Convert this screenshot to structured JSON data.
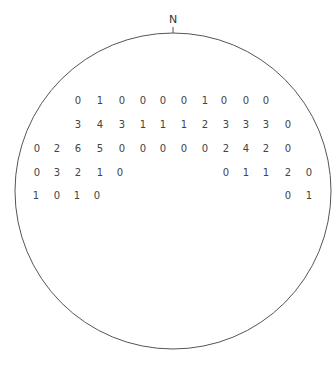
{
  "diagram": {
    "type": "stereonet-count-grid",
    "north_label": "N",
    "circle": {
      "cx": 173,
      "cy": 191,
      "r": 158,
      "stroke": "#555555"
    },
    "rows": [
      {
        "y": 100,
        "cells": [
          {
            "x": 78,
            "v": "0"
          },
          {
            "x": 100,
            "v": "1"
          },
          {
            "x": 122,
            "v": "0"
          },
          {
            "x": 143,
            "v": "0"
          },
          {
            "x": 163,
            "v": "0"
          },
          {
            "x": 184,
            "v": "0"
          },
          {
            "x": 205,
            "v": "1"
          },
          {
            "x": 224,
            "v": "0"
          },
          {
            "x": 246,
            "v": "0"
          },
          {
            "x": 266,
            "v": "0"
          }
        ]
      },
      {
        "y": 124,
        "cells": [
          {
            "x": 78,
            "v": "3"
          },
          {
            "x": 100,
            "v": "4"
          },
          {
            "x": 122,
            "v": "3"
          },
          {
            "x": 143,
            "v": "1"
          },
          {
            "x": 163,
            "v": "1"
          },
          {
            "x": 184,
            "v": "1"
          },
          {
            "x": 205,
            "v": "2"
          },
          {
            "x": 226,
            "v": "3"
          },
          {
            "x": 246,
            "v": "3"
          },
          {
            "x": 266,
            "v": "3"
          },
          {
            "x": 288,
            "v": "0"
          }
        ]
      },
      {
        "y": 148,
        "cells": [
          {
            "x": 37,
            "v": "0"
          },
          {
            "x": 57,
            "v": "2"
          },
          {
            "x": 78,
            "v": "6"
          },
          {
            "x": 100,
            "v": "5"
          },
          {
            "x": 122,
            "v": "0"
          },
          {
            "x": 143,
            "v": "0"
          },
          {
            "x": 163,
            "v": "0"
          },
          {
            "x": 184,
            "v": "0"
          },
          {
            "x": 205,
            "v": "0"
          },
          {
            "x": 226,
            "v": "2"
          },
          {
            "x": 246,
            "v": "4"
          },
          {
            "x": 266,
            "v": "2"
          },
          {
            "x": 288,
            "v": "0"
          }
        ]
      },
      {
        "y": 172,
        "cells": [
          {
            "x": 37,
            "v": "0"
          },
          {
            "x": 57,
            "v": "3"
          },
          {
            "x": 78,
            "v": "2"
          },
          {
            "x": 100,
            "v": "1"
          },
          {
            "x": 120,
            "v": "0"
          },
          {
            "x": 226,
            "v": "0"
          },
          {
            "x": 246,
            "v": "1"
          },
          {
            "x": 266,
            "v": "1"
          },
          {
            "x": 288,
            "v": "2"
          },
          {
            "x": 309,
            "v": "0"
          }
        ]
      },
      {
        "y": 195,
        "cells": [
          {
            "x": 36,
            "v": "1"
          },
          {
            "x": 57,
            "v": "0"
          },
          {
            "x": 77,
            "v": "1"
          },
          {
            "x": 97,
            "v": "0"
          },
          {
            "x": 288,
            "v": "0"
          },
          {
            "x": 309,
            "v": "1"
          }
        ]
      }
    ]
  }
}
